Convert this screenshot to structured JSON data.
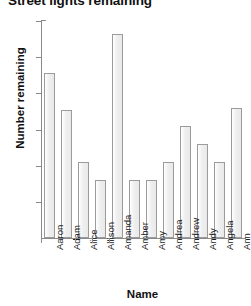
{
  "chart_data": {
    "type": "bar",
    "title": "Street lights remaining",
    "xlabel": "Name",
    "ylabel": "Number remaining",
    "categories": [
      "Aaron",
      "Adam",
      "Alice",
      "Allison",
      "Amanda",
      "Amber",
      "Amy",
      "Andrea",
      "Andrew",
      "Andy",
      "Angela",
      "Ann"
    ],
    "values": [
      9.1,
      7.1,
      4.2,
      3.2,
      11.3,
      3.2,
      3.2,
      4.2,
      6.2,
      5.2,
      4.2,
      7.2
    ],
    "ylim": [
      0,
      12
    ],
    "yticks": [
      0,
      2,
      4,
      6,
      8,
      10,
      12
    ],
    "ytick_labels": [
      "",
      "2",
      "4",
      "6",
      "8",
      "10",
      "12"
    ],
    "grid": false,
    "legend": false,
    "bar_fill_color": "#efefef",
    "bar_edge_color": "#9b9b9b",
    "axis_color": "#8a8a8a",
    "background_color": "#ffffff"
  }
}
